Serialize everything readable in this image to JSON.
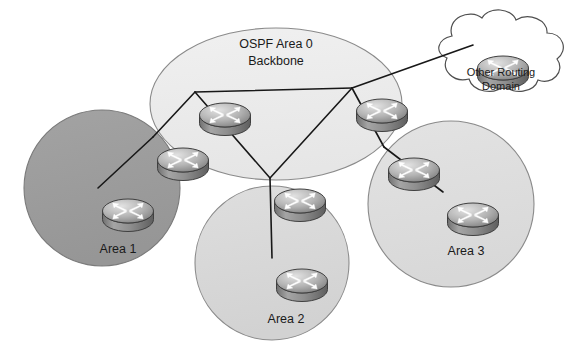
{
  "diagram": {
    "title": "OSPF Area 0 Backbone",
    "background_color": "#ffffff",
    "width": 577,
    "height": 350
  },
  "backbone": {
    "label_line1": "OSPF Area 0",
    "label_line2": "Backbone",
    "fill_color": "#ededed",
    "stroke_color": "#8a8a8a",
    "cx": 276,
    "cy": 104,
    "rx": 126,
    "ry": 76
  },
  "cloud": {
    "label_line1": "Other Routing",
    "label_line2": "Domain",
    "fill_color": "#ffffff",
    "stroke_color": "#555555"
  },
  "areas": [
    {
      "id": "area-1",
      "label": "Area 1",
      "fill_color": "#9c9c9c",
      "stroke_color": "#7a7a7a",
      "cx": 102,
      "cy": 188,
      "r": 78,
      "label_x": 118,
      "label_y": 253
    },
    {
      "id": "area-2",
      "label": "Area 2",
      "fill_color": "#d9d9d9",
      "stroke_color": "#8a8a8a",
      "cx": 272,
      "cy": 263,
      "r": 77,
      "label_x": 286,
      "label_y": 323
    },
    {
      "id": "area-3",
      "label": "Area 3",
      "fill_color": "#dedede",
      "stroke_color": "#8a8a8a",
      "cx": 451,
      "cy": 204,
      "r": 83,
      "label_x": 466,
      "label_y": 255
    }
  ],
  "routers": [
    {
      "id": "backbone-router-top-left",
      "x": 195,
      "y": 92,
      "scale": 1.0
    },
    {
      "id": "backbone-router-top-right",
      "x": 352,
      "y": 88,
      "scale": 1.0
    },
    {
      "id": "backbone-router-bottom",
      "x": 270,
      "y": 178,
      "scale": 1.0
    },
    {
      "id": "abr-router-area-1",
      "x": 153,
      "y": 137,
      "scale": 1.0
    },
    {
      "id": "internal-router-area-1",
      "x": 98,
      "y": 188,
      "scale": 1.0
    },
    {
      "id": "internal-router-area-2",
      "x": 272,
      "y": 258,
      "scale": 1.0
    },
    {
      "id": "abr-router-area-3",
      "x": 384,
      "y": 147,
      "scale": 1.0
    },
    {
      "id": "internal-router-area-3",
      "x": 443,
      "y": 192,
      "scale": 1.0
    },
    {
      "id": "cloud-router",
      "x": 473,
      "y": 45,
      "scale": 1.0
    }
  ],
  "links": [
    {
      "id": "link-backbone-top",
      "from": "backbone-router-top-left",
      "to": "backbone-router-top-right"
    },
    {
      "id": "link-backbone-left-down",
      "from": "backbone-router-top-left",
      "to": "backbone-router-bottom"
    },
    {
      "id": "link-backbone-right-down",
      "from": "backbone-router-top-right",
      "to": "backbone-router-bottom"
    },
    {
      "id": "link-abr1-backbone",
      "from": "abr-router-area-1",
      "to": "backbone-router-top-left"
    },
    {
      "id": "link-abr1-internal1",
      "from": "abr-router-area-1",
      "to": "internal-router-area-1"
    },
    {
      "id": "link-backbone-internal2",
      "from": "backbone-router-bottom",
      "to": "internal-router-area-2"
    },
    {
      "id": "link-abr3-backbone",
      "from": "abr-router-area-3",
      "to": "backbone-router-top-right"
    },
    {
      "id": "link-abr3-internal3",
      "from": "abr-router-area-3",
      "to": "internal-router-area-3"
    },
    {
      "id": "link-backbone-cloud",
      "from": "backbone-router-top-right",
      "to": "cloud-router"
    }
  ],
  "colors": {
    "link": "#181818",
    "router_top_light": "#d2d2d2",
    "router_top_dark": "#7b7b7b",
    "router_body_light": "#a8a8a8",
    "router_body_dark": "#6a6a6a",
    "router_outline": "#4a4a4a",
    "arrow_fill": "#ffffff",
    "text": "#1a1a1a"
  }
}
